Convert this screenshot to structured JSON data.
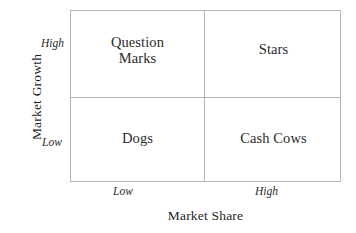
{
  "chart_data": {
    "type": "table",
    "title": "",
    "xlabel": "Market Share",
    "ylabel": "Market Growth",
    "x_ticks": [
      "Low",
      "High"
    ],
    "y_ticks": [
      "High",
      "Low"
    ],
    "grid": true,
    "legend": "none",
    "quadrants": [
      {
        "id": "question-marks",
        "label": "Question\nMarks",
        "market_share": "Low",
        "market_growth": "High"
      },
      {
        "id": "stars",
        "label": "Stars",
        "market_share": "High",
        "market_growth": "High"
      },
      {
        "id": "dogs",
        "label": "Dogs",
        "market_share": "Low",
        "market_growth": "Low"
      },
      {
        "id": "cash-cows",
        "label": "Cash Cows",
        "market_share": "High",
        "market_growth": "Low"
      }
    ],
    "colors": {
      "background": "#ffffff",
      "border": "#b4b4b4",
      "text": "#2b2b2b"
    }
  },
  "axes": {
    "y": {
      "title": "Market Growth",
      "high": "High",
      "low": "Low"
    },
    "x": {
      "title": "Market Share",
      "low": "Low",
      "high": "High"
    }
  },
  "cells": {
    "top_left": "Question\nMarks",
    "top_right": "Stars",
    "bottom_left": "Dogs",
    "bottom_right": "Cash Cows"
  }
}
